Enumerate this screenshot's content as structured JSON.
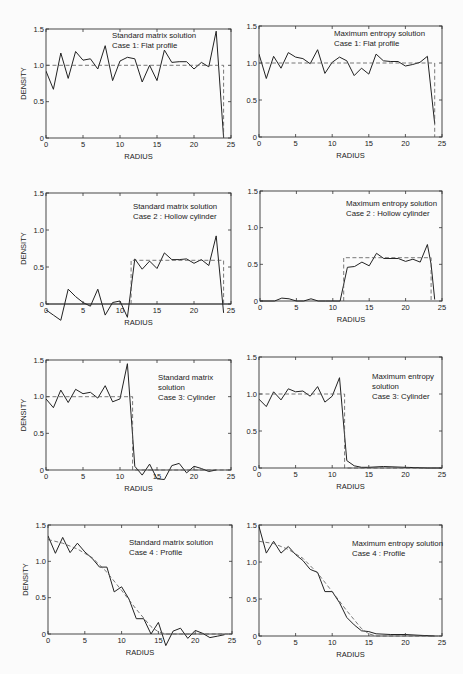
{
  "figure": {
    "panels_layout": "4 rows x 2 columns",
    "column_titles": [
      "Standard matrix solution",
      "Maximum entropy solution"
    ]
  },
  "chart_data": [
    {
      "id": "p1",
      "type": "line",
      "annotation": [
        "Standard matrix solution",
        "Case 1:  Flat profile"
      ],
      "xlabel": "RADIUS",
      "ylabel": "DENSITY",
      "xlim": [
        0,
        25
      ],
      "ylim": [
        0,
        1.5
      ],
      "xticks": [
        0,
        5,
        10,
        15,
        20,
        25
      ],
      "yticks": [
        0,
        0.5,
        1.0,
        1.5
      ],
      "ytick_labels": [
        "0",
        "0.5",
        "1.0",
        "1.5"
      ],
      "grid": false,
      "box": {
        "x0": 46,
        "x1": 231,
        "y0": 138,
        "y1": 29
      },
      "label_pos": {
        "x": 112,
        "y": 38
      },
      "series": [
        {
          "name": "reconstruction",
          "style": "solid",
          "x": [
            0,
            1,
            2,
            3,
            4,
            5,
            6,
            7,
            8,
            9,
            10,
            11,
            12,
            13,
            14,
            15,
            16,
            17,
            18,
            19,
            20,
            21,
            22,
            23,
            24
          ],
          "y": [
            0.92,
            0.67,
            1.17,
            0.82,
            1.19,
            1.07,
            1.09,
            0.95,
            1.27,
            0.79,
            1.06,
            1.11,
            1.09,
            0.77,
            1.0,
            0.79,
            1.21,
            1.04,
            1.05,
            1.05,
            0.95,
            1.04,
            0.98,
            1.47,
            0.0
          ]
        },
        {
          "name": "true profile",
          "style": "dashed",
          "x": [
            0,
            24,
            24
          ],
          "y": [
            1.0,
            1.0,
            0.0
          ]
        }
      ]
    },
    {
      "id": "p2",
      "type": "line",
      "annotation": [
        "Maximum entropy solution",
        "Case 1:  Flat profile"
      ],
      "xlabel": "RADIUS",
      "ylabel": "",
      "xlim": [
        0,
        25
      ],
      "ylim": [
        0,
        1.5
      ],
      "xticks": [
        0,
        5,
        10,
        15,
        20,
        25
      ],
      "yticks": [
        0,
        0.5,
        1.0,
        1.5
      ],
      "ytick_labels": [
        "0",
        "0.5",
        "1.0",
        "1.5"
      ],
      "grid": false,
      "box": {
        "x0": 259,
        "x1": 442,
        "y0": 137,
        "y1": 26
      },
      "label_pos": {
        "x": 334,
        "y": 36
      },
      "series": [
        {
          "name": "reconstruction",
          "style": "solid",
          "x": [
            0,
            1,
            2,
            3,
            4,
            5,
            6,
            7,
            8,
            9,
            10,
            11,
            12,
            13,
            14,
            15,
            16,
            17,
            18,
            19,
            20,
            21,
            22,
            23,
            24
          ],
          "y": [
            1.12,
            0.79,
            1.09,
            0.93,
            1.14,
            1.08,
            1.06,
            0.99,
            1.18,
            0.86,
            1.01,
            1.08,
            1.03,
            0.83,
            0.93,
            0.85,
            1.12,
            1.03,
            1.02,
            1.02,
            0.96,
            0.98,
            1.01,
            1.09,
            0.18
          ]
        },
        {
          "name": "true profile",
          "style": "dashed",
          "x": [
            0,
            24,
            24
          ],
          "y": [
            1.0,
            1.0,
            0.0
          ]
        }
      ]
    },
    {
      "id": "p3",
      "type": "line",
      "annotation": [
        "Standard matrix solution",
        "Case 2 :  Hollow cylinder"
      ],
      "xlabel": "RADIUS",
      "ylabel": "DENSITY",
      "xlim": [
        0,
        25
      ],
      "ylim": [
        -0.25,
        1.5
      ],
      "yaxis_zero_from": 0,
      "xticks": [
        0,
        5,
        10,
        15,
        20,
        25
      ],
      "yticks": [
        0,
        0.5,
        1.0,
        1.5
      ],
      "ytick_labels": [
        "0",
        "0.5",
        "1.0",
        "1.5"
      ],
      "grid": false,
      "box": {
        "x0": 46,
        "x1": 231,
        "y0": 304,
        "y1": 193,
        "zero_axis_y": 304
      },
      "label_pos": {
        "x": 133,
        "y": 209
      },
      "series": [
        {
          "name": "reconstruction",
          "style": "solid",
          "x": [
            0,
            1,
            2,
            3,
            4,
            5,
            6,
            7,
            8,
            9,
            10,
            11,
            12,
            13,
            14,
            15,
            16,
            17,
            18,
            19,
            20,
            21,
            22,
            23,
            24
          ],
          "y": [
            -0.08,
            -0.15,
            -0.22,
            0.2,
            0.1,
            0.02,
            -0.03,
            0.2,
            -0.15,
            0.02,
            0.04,
            -0.18,
            0.61,
            0.47,
            0.58,
            0.48,
            0.69,
            0.6,
            0.6,
            0.61,
            0.55,
            0.6,
            0.52,
            0.92,
            -0.12
          ]
        },
        {
          "name": "true profile",
          "style": "dashed",
          "x": [
            11.5,
            11.5,
            24,
            24
          ],
          "y": [
            0.0,
            0.59,
            0.59,
            0.0
          ]
        }
      ]
    },
    {
      "id": "p4",
      "type": "line",
      "annotation": [
        "Maximum entropy solution",
        "Case 2 :  Hollow cylinder"
      ],
      "xlabel": "RADIUS",
      "ylabel": "",
      "xlim": [
        0,
        25
      ],
      "ylim": [
        0,
        1.5
      ],
      "xticks": [
        0,
        5,
        10,
        15,
        20,
        25
      ],
      "yticks": [
        0,
        0.5,
        1.0,
        1.5
      ],
      "ytick_labels": [
        "0",
        "0.5",
        "1.0",
        "1.5"
      ],
      "grid": false,
      "box": {
        "x0": 260,
        "x1": 442,
        "y0": 301,
        "y1": 191
      },
      "label_pos": {
        "x": 346,
        "y": 206
      },
      "series": [
        {
          "name": "reconstruction",
          "style": "solid",
          "x": [
            0,
            2,
            3,
            4,
            5,
            6,
            7,
            8,
            9,
            10,
            11,
            12,
            13,
            14,
            15,
            16,
            17,
            18,
            19,
            20,
            21,
            22,
            23,
            23.5,
            24
          ],
          "y": [
            0.0,
            0.0,
            0.04,
            0.03,
            0.0,
            0.0,
            0.03,
            0.0,
            0.0,
            0.0,
            0.0,
            0.46,
            0.47,
            0.53,
            0.48,
            0.65,
            0.58,
            0.58,
            0.58,
            0.54,
            0.57,
            0.53,
            0.77,
            0.5,
            0.02
          ]
        },
        {
          "name": "true profile",
          "style": "dashed",
          "x": [
            11.5,
            11.5,
            23.5,
            23.5
          ],
          "y": [
            0.0,
            0.59,
            0.59,
            0.0
          ]
        }
      ]
    },
    {
      "id": "p5",
      "type": "line",
      "annotation": [
        "Standard matrix",
        "solution",
        "Case 3:  Cylinder"
      ],
      "xlabel": "RADIUS",
      "ylabel": "DENSITY",
      "xlim": [
        0,
        25
      ],
      "ylim": [
        0,
        1.5
      ],
      "xticks": [
        0,
        5,
        10,
        15,
        20,
        25
      ],
      "yticks": [
        0,
        0.5,
        1.0,
        1.5
      ],
      "ytick_labels": [
        "0",
        "0.5",
        "1.0",
        "1.5"
      ],
      "grid": false,
      "box": {
        "x0": 46,
        "x1": 231,
        "y0": 470,
        "y1": 360
      },
      "label_pos": {
        "x": 158,
        "y": 380
      },
      "series": [
        {
          "name": "reconstruction",
          "style": "solid",
          "x": [
            0,
            1,
            2,
            3,
            4,
            5,
            6,
            7,
            8,
            9,
            10,
            11,
            12,
            13,
            14,
            15,
            16,
            17,
            18,
            19,
            20,
            21,
            22,
            23
          ],
          "y": [
            0.97,
            0.85,
            1.09,
            0.92,
            1.1,
            1.04,
            1.06,
            0.98,
            1.15,
            0.93,
            0.97,
            1.45,
            0.05,
            -0.07,
            0.08,
            -0.12,
            -0.13,
            0.06,
            0.09,
            -0.04,
            0.05,
            0.02,
            -0.02,
            0.0
          ]
        },
        {
          "name": "true profile",
          "style": "dashed",
          "x": [
            0,
            11.7,
            11.7,
            25
          ],
          "y": [
            1.0,
            1.0,
            0.0,
            0.0
          ]
        }
      ]
    },
    {
      "id": "p6",
      "type": "line",
      "annotation": [
        "Maximum entropy",
        "solution",
        "Case 3:  Cylinder"
      ],
      "xlabel": "RADIUS",
      "ylabel": "",
      "xlim": [
        0,
        25
      ],
      "ylim": [
        0,
        1.5
      ],
      "xticks": [
        0,
        5,
        10,
        15,
        20,
        25
      ],
      "yticks": [
        0,
        0.5,
        1.0,
        1.5
      ],
      "ytick_labels": [
        "0",
        "0.5",
        "1.0",
        "1.5"
      ],
      "grid": false,
      "box": {
        "x0": 259,
        "x1": 442,
        "y0": 468,
        "y1": 357
      },
      "label_pos": {
        "x": 372,
        "y": 379
      },
      "series": [
        {
          "name": "reconstruction",
          "style": "solid",
          "x": [
            0,
            1,
            2,
            3,
            4,
            5,
            6,
            7,
            8,
            9,
            10,
            11,
            12,
            13,
            14,
            15,
            17,
            20,
            23,
            25
          ],
          "y": [
            0.93,
            0.83,
            1.03,
            0.92,
            1.07,
            1.03,
            1.04,
            0.97,
            1.1,
            0.89,
            0.97,
            1.22,
            0.1,
            0.03,
            0.01,
            0.01,
            0.02,
            0.01,
            0.0,
            0.0
          ]
        },
        {
          "name": "true profile",
          "style": "dashed",
          "x": [
            0,
            11.7,
            11.7,
            25
          ],
          "y": [
            1.0,
            1.0,
            0.0,
            0.0
          ]
        }
      ]
    },
    {
      "id": "p7",
      "type": "line",
      "annotation": [
        "Standard matrix solution",
        "Case 4 :  Profile"
      ],
      "xlabel": "RADIUS",
      "ylabel": "DENSITY",
      "xlim": [
        0,
        25
      ],
      "ylim": [
        0,
        1.5
      ],
      "xticks": [
        0,
        5,
        10,
        15,
        20,
        25
      ],
      "yticks": [
        0,
        0.5,
        1.0,
        1.5
      ],
      "ytick_labels": [
        "0",
        "0.5",
        "1.0",
        "1.5"
      ],
      "grid": false,
      "box": {
        "x0": 48,
        "x1": 232,
        "y0": 634,
        "y1": 525
      },
      "label_pos": {
        "x": 129,
        "y": 545
      },
      "series": [
        {
          "name": "reconstruction",
          "style": "solid",
          "x": [
            0,
            1,
            2,
            3,
            4,
            5,
            6,
            7,
            8,
            9,
            10,
            11,
            12,
            13,
            14,
            15,
            16,
            17,
            18,
            19,
            20,
            21,
            22,
            23,
            24
          ],
          "y": [
            1.35,
            1.11,
            1.33,
            1.12,
            1.25,
            1.13,
            1.04,
            0.92,
            0.92,
            0.58,
            0.65,
            0.48,
            0.21,
            0.21,
            0.0,
            0.16,
            -0.16,
            0.04,
            0.08,
            -0.06,
            0.05,
            0.01,
            -0.05,
            -0.03,
            -0.01
          ]
        },
        {
          "name": "true profile",
          "style": "dashed",
          "x": [
            0,
            2,
            4,
            6,
            8,
            10,
            12,
            14,
            15,
            16,
            18,
            20,
            22,
            24,
            25
          ],
          "y": [
            1.3,
            1.25,
            1.17,
            1.05,
            0.85,
            0.6,
            0.34,
            0.1,
            0.03,
            0.0,
            0.0,
            0.0,
            0.0,
            0.0,
            0.0
          ]
        }
      ]
    },
    {
      "id": "p8",
      "type": "line",
      "annotation": [
        "Maximum entropy solution",
        "Case 4 :  Profile"
      ],
      "xlabel": "RADIUS",
      "ylabel": "",
      "xlim": [
        0,
        25
      ],
      "ylim": [
        0,
        1.5
      ],
      "xticks": [
        0,
        5,
        10,
        15,
        20,
        25
      ],
      "yticks": [
        0,
        0.5,
        1.0,
        1.5
      ],
      "ytick_labels": [
        "0",
        "0.5",
        "1.0",
        "1.5"
      ],
      "grid": false,
      "box": {
        "x0": 259,
        "x1": 442,
        "y0": 636,
        "y1": 525
      },
      "label_pos": {
        "x": 352,
        "y": 546
      },
      "series": [
        {
          "name": "reconstruction",
          "style": "solid",
          "x": [
            0,
            1,
            2,
            3,
            4,
            5,
            6,
            7,
            8,
            9,
            10,
            11,
            12,
            13,
            14,
            15,
            16,
            18,
            20,
            22,
            24
          ],
          "y": [
            1.48,
            1.12,
            1.28,
            1.12,
            1.21,
            1.1,
            1.02,
            0.9,
            0.86,
            0.6,
            0.6,
            0.45,
            0.25,
            0.15,
            0.07,
            0.06,
            0.03,
            0.02,
            0.02,
            0.01,
            0.0
          ]
        },
        {
          "name": "true profile",
          "style": "dashed",
          "x": [
            0,
            2,
            4,
            6,
            8,
            10,
            12,
            14,
            15,
            16,
            18,
            20,
            22,
            24,
            25
          ],
          "y": [
            1.28,
            1.25,
            1.17,
            1.05,
            0.85,
            0.6,
            0.34,
            0.1,
            0.03,
            0.0,
            0.0,
            0.0,
            0.0,
            0.0,
            0.0
          ]
        }
      ]
    }
  ]
}
